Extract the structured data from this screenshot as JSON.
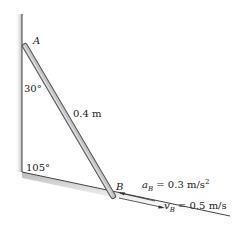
{
  "diagram": {
    "type": "mechanics-rod-sliding",
    "points": {
      "A": {
        "label": "A"
      },
      "B": {
        "label": "B"
      }
    },
    "angles": {
      "top": "30°",
      "bottom": "105°"
    },
    "rod_length": "0.4 m",
    "acceleration": {
      "symbol": "a",
      "subscript": "B",
      "equals": " = 0.3 m/s",
      "exponent": "2"
    },
    "velocity": {
      "symbol": "v",
      "subscript": "B",
      "equals": " = 0.5 m/s"
    },
    "colors": {
      "wall_shade": "#c8c8c8",
      "rod_fill": "#bdbdbd",
      "rod_outline": "#555555",
      "line": "#333333"
    }
  }
}
